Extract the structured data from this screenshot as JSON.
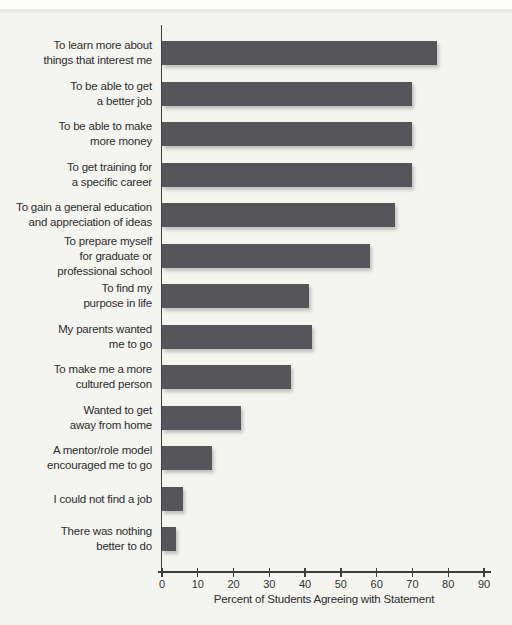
{
  "page": {
    "background_color": "#f4f4f0",
    "text_color": "#2d2d2d"
  },
  "chart_data": {
    "type": "bar",
    "orientation": "horizontal",
    "title": "",
    "xlabel": "Percent of Students Agreeing with Statement",
    "ylabel": "",
    "xlim": [
      0,
      90
    ],
    "xticks": [
      0,
      10,
      20,
      30,
      40,
      50,
      60,
      70,
      80,
      90
    ],
    "grid": false,
    "legend": null,
    "bar_color": "#55555a",
    "axis_color": "#3e3e3e",
    "categories": [
      [
        "To learn more about",
        "things that interest me"
      ],
      [
        "To be able to get",
        "a better job"
      ],
      [
        "To be able to make",
        "more money"
      ],
      [
        "To get training for",
        "a specific career"
      ],
      [
        "To gain a general education",
        "and appreciation of ideas"
      ],
      [
        "To prepare myself",
        "for graduate or",
        "professional school"
      ],
      [
        "To find my",
        "purpose in life"
      ],
      [
        "My parents wanted",
        "me to go"
      ],
      [
        "To make me a more",
        "cultured person"
      ],
      [
        "Wanted to get",
        "away from home"
      ],
      [
        "A mentor/role model",
        "encouraged me to go"
      ],
      [
        "I could not find a job"
      ],
      [
        "There was nothing",
        "better to do"
      ]
    ],
    "values": [
      77,
      70,
      70,
      70,
      65,
      58,
      41,
      42,
      36,
      22,
      14,
      6,
      4
    ]
  }
}
